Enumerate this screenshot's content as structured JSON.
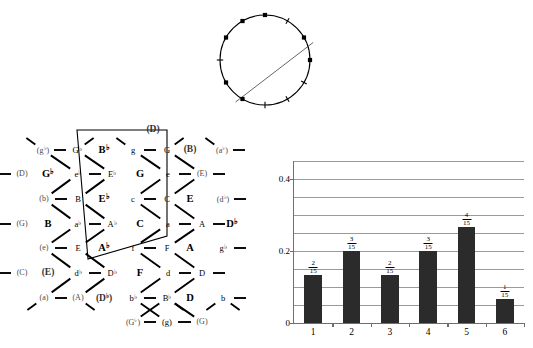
{
  "figure": {
    "background": "#ffffff",
    "ink": "#000000"
  },
  "circle": {
    "name": "chromatic-circle",
    "radius_px": 45,
    "center": {
      "x": 60,
      "y": 60
    },
    "positions": 12,
    "chord_line": {
      "from_deg": 340,
      "to_deg": 125,
      "color": "#555555"
    },
    "marks": [
      {
        "index": 0,
        "angle_deg": -90,
        "type": "square",
        "filled": true
      },
      {
        "index": 1,
        "angle_deg": -60,
        "type": "tick",
        "filled": false
      },
      {
        "index": 2,
        "angle_deg": -30,
        "type": "square",
        "filled": true
      },
      {
        "index": 3,
        "angle_deg": 0,
        "type": "square",
        "filled": true
      },
      {
        "index": 4,
        "angle_deg": 30,
        "type": "tick",
        "filled": false
      },
      {
        "index": 5,
        "angle_deg": 60,
        "type": "tick",
        "filled": false
      },
      {
        "index": 6,
        "angle_deg": 90,
        "type": "tick",
        "filled": false
      },
      {
        "index": 7,
        "angle_deg": 120,
        "type": "square",
        "filled": true
      },
      {
        "index": 8,
        "angle_deg": 150,
        "type": "square",
        "filled": true
      },
      {
        "index": 9,
        "angle_deg": 180,
        "type": "tick",
        "filled": false
      },
      {
        "index": 10,
        "angle_deg": 210,
        "type": "square",
        "filled": true
      },
      {
        "index": 11,
        "angle_deg": 240,
        "type": "square",
        "filled": true
      }
    ]
  },
  "tonnetz": {
    "name": "tonnetz-lattice",
    "note_nodes": [
      {
        "text": "(g♭)",
        "x": 43,
        "y": 28,
        "paren": true
      },
      {
        "text": "G♭",
        "x": 77,
        "y": 28,
        "paren": false
      },
      {
        "text": "g",
        "x": 133,
        "y": 28,
        "paren": false
      },
      {
        "text": "G",
        "x": 167,
        "y": 28,
        "paren": false
      },
      {
        "text": "(a♭)",
        "x": 222,
        "y": 28,
        "paren": true
      },
      {
        "text": "(D)",
        "x": 22,
        "y": 52,
        "paren": true
      },
      {
        "text": "e♭",
        "x": 78,
        "y": 52,
        "paren": false
      },
      {
        "text": "E♭",
        "x": 112,
        "y": 52,
        "paren": false
      },
      {
        "text": "e",
        "x": 168,
        "y": 52,
        "paren": false
      },
      {
        "text": "(E)",
        "x": 202,
        "y": 52,
        "paren": true
      },
      {
        "text": "(b)",
        "x": 44,
        "y": 77,
        "paren": true
      },
      {
        "text": "B",
        "x": 78,
        "y": 77,
        "paren": false
      },
      {
        "text": "c",
        "x": 133,
        "y": 77,
        "paren": false
      },
      {
        "text": "C",
        "x": 167,
        "y": 77,
        "paren": false
      },
      {
        "text": "(d♭)",
        "x": 223,
        "y": 77,
        "paren": true
      },
      {
        "text": "(G)",
        "x": 22,
        "y": 102,
        "paren": true
      },
      {
        "text": "a♭",
        "x": 78,
        "y": 102,
        "paren": false
      },
      {
        "text": "A♭",
        "x": 112,
        "y": 102,
        "paren": false
      },
      {
        "text": "a",
        "x": 168,
        "y": 102,
        "paren": false
      },
      {
        "text": "A",
        "x": 202,
        "y": 102,
        "paren": false
      },
      {
        "text": "(e)",
        "x": 44,
        "y": 126,
        "paren": true
      },
      {
        "text": "E",
        "x": 78,
        "y": 126,
        "paren": false
      },
      {
        "text": "f",
        "x": 133,
        "y": 126,
        "paren": false
      },
      {
        "text": "F",
        "x": 167,
        "y": 126,
        "paren": false
      },
      {
        "text": "g♭",
        "x": 223,
        "y": 126,
        "paren": false
      },
      {
        "text": "(C)",
        "x": 22,
        "y": 151,
        "paren": true
      },
      {
        "text": "d♭",
        "x": 78,
        "y": 151,
        "paren": false
      },
      {
        "text": "D♭",
        "x": 112,
        "y": 151,
        "paren": false
      },
      {
        "text": "d",
        "x": 168,
        "y": 151,
        "paren": false
      },
      {
        "text": "D",
        "x": 202,
        "y": 151,
        "paren": false
      },
      {
        "text": "(a)",
        "x": 44,
        "y": 176,
        "paren": true
      },
      {
        "text": "(A)",
        "x": 78,
        "y": 176,
        "paren": true
      },
      {
        "text": "b♭",
        "x": 133,
        "y": 176,
        "paren": false
      },
      {
        "text": "B♭",
        "x": 167,
        "y": 176,
        "paren": false
      },
      {
        "text": "b",
        "x": 223,
        "y": 176,
        "paren": false
      },
      {
        "text": "(G♭)",
        "x": 133,
        "y": 200,
        "paren": true
      },
      {
        "text": "(g)",
        "x": 167,
        "y": 200,
        "paren": false
      },
      {
        "text": "(G)",
        "x": 202,
        "y": 200,
        "paren": true
      }
    ],
    "triad_labels": [
      {
        "text": "(D)",
        "x": 153,
        "y": 8,
        "paren": true
      },
      {
        "text": "B♭",
        "x": 104,
        "y": 28,
        "paren": false
      },
      {
        "text": "(B)",
        "x": 190,
        "y": 28,
        "paren": true
      },
      {
        "text": "G♭",
        "x": 48,
        "y": 52,
        "paren": false
      },
      {
        "text": "G",
        "x": 140,
        "y": 52,
        "paren": false
      },
      {
        "text": "E♭",
        "x": 104,
        "y": 77,
        "paren": false
      },
      {
        "text": "E",
        "x": 190,
        "y": 77,
        "paren": false
      },
      {
        "text": "B",
        "x": 48,
        "y": 102,
        "paren": false
      },
      {
        "text": "C",
        "x": 140,
        "y": 102,
        "paren": false
      },
      {
        "text": "D♭",
        "x": 232,
        "y": 102,
        "paren": false
      },
      {
        "text": "A♭",
        "x": 104,
        "y": 126,
        "paren": false
      },
      {
        "text": "A",
        "x": 190,
        "y": 126,
        "paren": false
      },
      {
        "text": "(E)",
        "x": 48,
        "y": 151,
        "paren": true
      },
      {
        "text": "F",
        "x": 140,
        "y": 151,
        "paren": false
      },
      {
        "text": "(D♭)",
        "x": 104,
        "y": 176,
        "paren": true
      },
      {
        "text": "D",
        "x": 190,
        "y": 176,
        "paren": false
      }
    ],
    "region": {
      "name": "fundamental-domain",
      "points": "77,8 167,8 167,114 88,137",
      "stroke": "#000000",
      "fill": "none"
    }
  },
  "chart_data": {
    "type": "bar",
    "title": "",
    "xlabel": "",
    "ylabel": "",
    "categories": [
      "1",
      "2",
      "3",
      "4",
      "5",
      "6"
    ],
    "values": [
      0.1333,
      0.2,
      0.1333,
      0.2,
      0.2667,
      0.0667
    ],
    "value_labels": [
      {
        "num": "2",
        "den": "15"
      },
      {
        "num": "3",
        "den": "15"
      },
      {
        "num": "2",
        "den": "15"
      },
      {
        "num": "3",
        "den": "15"
      },
      {
        "num": "4",
        "den": "15"
      },
      {
        "num": "1",
        "den": "15"
      }
    ],
    "ytick_labels": [
      "0",
      "0.2",
      "0.4"
    ],
    "yticks": [
      0,
      0.2,
      0.4
    ],
    "gridlines": [
      0.05,
      0.1,
      0.15,
      0.2,
      0.25,
      0.3,
      0.35,
      0.4,
      0.45
    ],
    "ylim": [
      0,
      0.45
    ],
    "grid": true,
    "legend": "none",
    "bar_color": "#2b2b2b",
    "grid_color": "#9a9a9a"
  }
}
